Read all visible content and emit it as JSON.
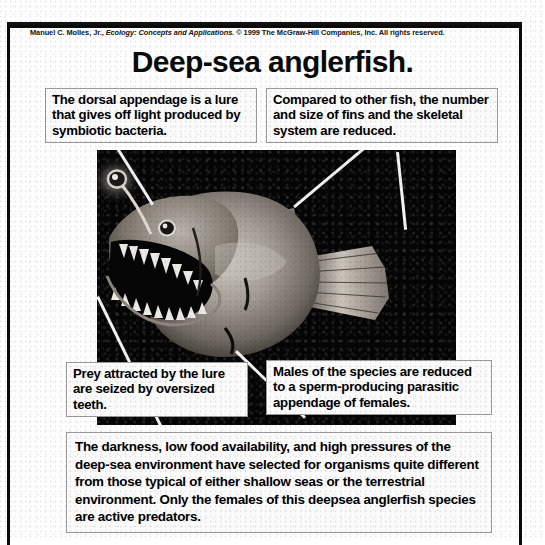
{
  "slide": {
    "credit_prefix": "Manuel C. Molles, Jr., ",
    "credit_italic": "Ecology: Concepts and Applications.",
    "credit_suffix": " © 1999 The McGraw-Hill Companies, Inc. All rights reserved.",
    "title": "Deep-sea anglerfish.",
    "frame_color": "#0b0b0b",
    "photo_background": "#050505",
    "callout_background": "#fbfbfb",
    "callout_border_color": "#9a9a9a",
    "text_color": "#000000"
  },
  "figure": {
    "subject": "deep-sea anglerfish",
    "illustration_name": "anglerfish-illustration",
    "leader_line_color": "#f2f2f2"
  },
  "callouts": [
    {
      "id": "dorsal-appendage",
      "text": "The dorsal appendage is a lure that gives off light produced by symbiotic bacteria."
    },
    {
      "id": "fins-and-skeleton",
      "text": "Compared to other fish, the number and size of fins and the skeletal system are reduced."
    },
    {
      "id": "prey-capture",
      "text": "Prey attracted by the lure are seized by oversized teeth."
    },
    {
      "id": "parasitic-males",
      "text": "Males of the species are reduced to a sperm-producing parasitic appendage of females."
    }
  ],
  "summary": {
    "id": "deep-sea-environment-summary",
    "text": "The darkness, low food availability, and high pressures of the deep-sea environment have selected for organisms quite different from those typical of either shallow seas or the terrestrial environment.  Only the females of this deepsea anglerfish species are active predators."
  }
}
